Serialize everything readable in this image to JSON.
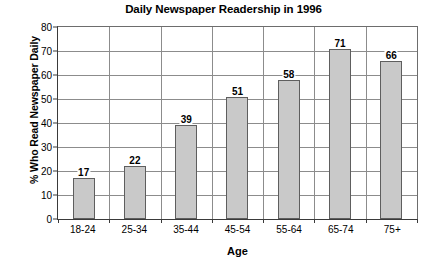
{
  "chart_data": {
    "type": "bar",
    "title": "Daily Newspaper Readership in 1996",
    "xlabel": "Age",
    "ylabel": "% Who Read Newspaper Daily",
    "categories": [
      "18-24",
      "25-34",
      "35-44",
      "45-54",
      "55-64",
      "65-74",
      "75+"
    ],
    "values": [
      17,
      22,
      39,
      51,
      58,
      71,
      66
    ],
    "ylim": [
      0,
      80
    ],
    "ytick_step": 10,
    "yticks": [
      "0",
      "10",
      "20",
      "30",
      "40",
      "50",
      "60",
      "70",
      "80"
    ],
    "grid": "horizontal",
    "legend": "none",
    "bar_fill_color": "#c9c9c9",
    "bar_border_color": "#5e5e5e",
    "gridline_color": "#8c8c8c",
    "axis_color": "#3a3a3a",
    "background_color": "#ffffff",
    "data_labels": [
      "17",
      "22",
      "39",
      "51",
      "58",
      "71",
      "66"
    ]
  }
}
